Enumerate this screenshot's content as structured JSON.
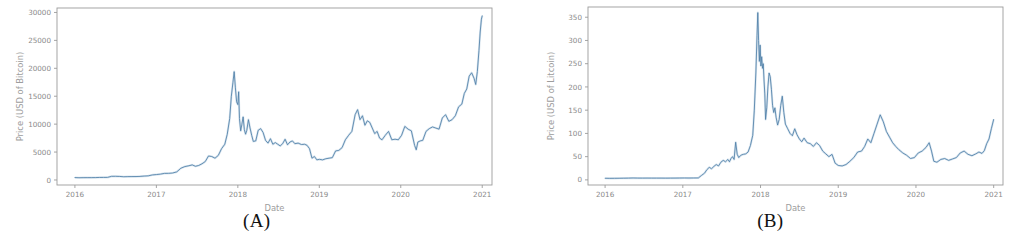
{
  "figure": {
    "background": "#ffffff",
    "panels": [
      {
        "id": "panel-a",
        "caption": "(A)",
        "chart_data": {
          "type": "line",
          "title": "",
          "xlabel": "Date",
          "ylabel": "Price (USD of Bitcoin)",
          "line_color": "#4f7fa8",
          "accent_color": "#2f6ea8",
          "axis_color": "#9b9b9b",
          "label_color": "#8a8a8a",
          "grid": false,
          "legend": "none",
          "xlim": [
            2015.78,
            2021.12
          ],
          "ylim": [
            -900,
            30800
          ],
          "xticks": [
            2016,
            2017,
            2018,
            2019,
            2020,
            2021
          ],
          "xtick_labels": [
            "2016",
            "2017",
            "2018",
            "2019",
            "2020",
            "2021"
          ],
          "yticks": [
            0,
            5000,
            10000,
            15000,
            20000,
            25000,
            30000
          ],
          "ytick_labels": [
            "0",
            "5000",
            "10000",
            "15000",
            "20000",
            "25000",
            "30000"
          ],
          "series": [
            {
              "name": "Bitcoin close price",
              "x": [
                2016.0,
                2016.05,
                2016.1,
                2016.15,
                2016.2,
                2016.25,
                2016.3,
                2016.35,
                2016.4,
                2016.45,
                2016.5,
                2016.55,
                2016.6,
                2016.65,
                2016.7,
                2016.75,
                2016.8,
                2016.85,
                2016.9,
                2016.95,
                2017.0,
                2017.05,
                2017.1,
                2017.15,
                2017.2,
                2017.25,
                2017.3,
                2017.35,
                2017.4,
                2017.44,
                2017.48,
                2017.52,
                2017.56,
                2017.6,
                2017.64,
                2017.68,
                2017.72,
                2017.76,
                2017.8,
                2017.84,
                2017.87,
                2017.9,
                2017.92,
                2017.94,
                2017.955,
                2017.97,
                2017.985,
                2018.0,
                2018.01,
                2018.02,
                2018.035,
                2018.05,
                2018.065,
                2018.08,
                2018.095,
                2018.11,
                2018.13,
                2018.15,
                2018.17,
                2018.19,
                2018.22,
                2018.25,
                2018.28,
                2018.31,
                2018.34,
                2018.37,
                2018.4,
                2018.43,
                2018.46,
                2018.49,
                2018.52,
                2018.55,
                2018.58,
                2018.61,
                2018.64,
                2018.67,
                2018.7,
                2018.74,
                2018.78,
                2018.82,
                2018.85,
                2018.88,
                2018.91,
                2018.94,
                2018.97,
                2019.0,
                2019.04,
                2019.08,
                2019.12,
                2019.16,
                2019.2,
                2019.24,
                2019.28,
                2019.32,
                2019.36,
                2019.4,
                2019.44,
                2019.47,
                2019.5,
                2019.53,
                2019.56,
                2019.59,
                2019.62,
                2019.65,
                2019.68,
                2019.71,
                2019.74,
                2019.77,
                2019.81,
                2019.85,
                2019.89,
                2019.93,
                2019.97,
                2020.01,
                2020.05,
                2020.09,
                2020.13,
                2020.17,
                2020.19,
                2020.21,
                2020.24,
                2020.27,
                2020.31,
                2020.35,
                2020.39,
                2020.43,
                2020.47,
                2020.51,
                2020.55,
                2020.59,
                2020.63,
                2020.67,
                2020.71,
                2020.75,
                2020.78,
                2020.81,
                2020.84,
                2020.87,
                2020.9,
                2020.92,
                2020.94,
                2020.96,
                2020.975,
                2020.99,
                2021.0
              ],
              "y": [
                430,
                400,
                415,
                420,
                420,
                430,
                450,
                455,
                465,
                655,
                660,
                630,
                575,
                600,
                610,
                615,
                640,
                700,
                740,
                900,
                970,
                1050,
                1180,
                1190,
                1250,
                1450,
                2100,
                2400,
                2550,
                2700,
                2450,
                2600,
                2900,
                3300,
                4300,
                4200,
                3900,
                4400,
                5600,
                6400,
                8200,
                11000,
                15000,
                17500,
                19400,
                16500,
                14000,
                13500,
                15800,
                11000,
                8800,
                10000,
                11300,
                9000,
                8200,
                8900,
                10800,
                9300,
                8000,
                6900,
                7000,
                8900,
                9200,
                8500,
                7100,
                6600,
                7400,
                6400,
                6700,
                6400,
                6100,
                6500,
                7300,
                6300,
                6800,
                7000,
                6500,
                6600,
                6350,
                6400,
                6200,
                5600,
                3900,
                4200,
                3600,
                3700,
                3600,
                3800,
                3900,
                4000,
                5200,
                5300,
                5800,
                7200,
                8000,
                8700,
                11700,
                12600,
                10800,
                11500,
                9800,
                10600,
                10300,
                9300,
                8300,
                8700,
                7500,
                7200,
                8000,
                8700,
                7200,
                7300,
                7200,
                8000,
                9600,
                9100,
                8800,
                6200,
                5400,
                6800,
                7000,
                7100,
                8700,
                9200,
                9500,
                9300,
                9100,
                11100,
                11700,
                10500,
                10800,
                11500,
                13100,
                13600,
                15500,
                16300,
                18600,
                19200,
                18200,
                17100,
                19400,
                23200,
                26500,
                28800,
                29400
              ]
            }
          ]
        },
        "axes": {
          "xlabel_text": "Date",
          "ylabel_text": "Price (USD of Bitcoin)"
        }
      },
      {
        "id": "panel-b",
        "caption": "(B)",
        "chart_data": {
          "type": "line",
          "title": "",
          "xlabel": "Date",
          "ylabel": "Price (USD of Litcoin)",
          "line_color": "#4f7fa8",
          "accent_color": "#2f6ea8",
          "axis_color": "#9b9b9b",
          "label_color": "#8a8a8a",
          "grid": false,
          "legend": "none",
          "xlim": [
            2015.78,
            2021.12
          ],
          "ylim": [
            -11,
            372
          ],
          "xticks": [
            2016,
            2017,
            2018,
            2019,
            2020,
            2021
          ],
          "xtick_labels": [
            "2016",
            "2017",
            "2018",
            "2019",
            "2020",
            "2021"
          ],
          "yticks": [
            0,
            50,
            100,
            150,
            200,
            250,
            300,
            350
          ],
          "ytick_labels": [
            "0",
            "50",
            "100",
            "150",
            "200",
            "250",
            "300",
            "350"
          ],
          "series": [
            {
              "name": "Litecoin close price",
              "x": [
                2016.0,
                2016.06,
                2016.12,
                2016.18,
                2016.24,
                2016.3,
                2016.36,
                2016.42,
                2016.48,
                2016.54,
                2016.6,
                2016.66,
                2016.72,
                2016.78,
                2016.84,
                2016.9,
                2016.96,
                2017.02,
                2017.08,
                2017.14,
                2017.2,
                2017.24,
                2017.28,
                2017.31,
                2017.34,
                2017.37,
                2017.4,
                2017.43,
                2017.46,
                2017.49,
                2017.52,
                2017.55,
                2017.58,
                2017.6,
                2017.62,
                2017.64,
                2017.66,
                2017.68,
                2017.7,
                2017.72,
                2017.74,
                2017.76,
                2017.78,
                2017.81,
                2017.84,
                2017.87,
                2017.9,
                2017.92,
                2017.94,
                2017.955,
                2017.965,
                2017.975,
                2017.985,
                2017.995,
                2018.005,
                2018.015,
                2018.025,
                2018.035,
                2018.045,
                2018.055,
                2018.065,
                2018.08,
                2018.095,
                2018.11,
                2018.125,
                2018.14,
                2018.155,
                2018.17,
                2018.185,
                2018.2,
                2018.22,
                2018.24,
                2018.26,
                2018.28,
                2018.3,
                2018.32,
                2018.35,
                2018.38,
                2018.41,
                2018.44,
                2018.47,
                2018.5,
                2018.53,
                2018.56,
                2018.6,
                2018.64,
                2018.68,
                2018.72,
                2018.76,
                2018.8,
                2018.84,
                2018.88,
                2018.92,
                2018.96,
                2019.0,
                2019.05,
                2019.1,
                2019.15,
                2019.2,
                2019.25,
                2019.3,
                2019.34,
                2019.38,
                2019.42,
                2019.46,
                2019.5,
                2019.54,
                2019.58,
                2019.62,
                2019.66,
                2019.7,
                2019.74,
                2019.78,
                2019.83,
                2019.88,
                2019.93,
                2019.98,
                2020.03,
                2020.08,
                2020.13,
                2020.17,
                2020.2,
                2020.23,
                2020.27,
                2020.32,
                2020.37,
                2020.42,
                2020.47,
                2020.52,
                2020.57,
                2020.62,
                2020.67,
                2020.72,
                2020.77,
                2020.81,
                2020.85,
                2020.88,
                2020.91,
                2020.94,
                2020.97,
                2021.0
              ],
              "y": [
                3.5,
                3.3,
                3.4,
                3.5,
                3.6,
                3.8,
                4.1,
                3.9,
                3.8,
                3.9,
                3.8,
                3.8,
                3.8,
                3.7,
                3.8,
                3.9,
                4.0,
                4.1,
                4.0,
                4.1,
                4.2,
                9.5,
                14.5,
                22.0,
                27.0,
                24.0,
                29.0,
                33.0,
                30.0,
                38.0,
                42.0,
                39.0,
                44.0,
                39.0,
                46.0,
                50.0,
                44.0,
                81.0,
                55.0,
                48.0,
                52.0,
                54.0,
                55.0,
                56.0,
                60.0,
                74.0,
                96.0,
                150.0,
                230.0,
                310.0,
                360.0,
                300.0,
                255.0,
                290.0,
                245.0,
                265.0,
                240.0,
                250.0,
                215.0,
                185.0,
                130.0,
                155.0,
                200.0,
                230.0,
                222.0,
                195.0,
                160.0,
                145.0,
                155.0,
                135.0,
                118.0,
                130.0,
                160.0,
                180.0,
                145.0,
                120.0,
                110.0,
                100.0,
                95.0,
                110.0,
                97.0,
                88.0,
                82.0,
                90.0,
                80.0,
                78.0,
                72.0,
                80.0,
                74.0,
                62.0,
                56.0,
                50.0,
                55.0,
                36.0,
                31.0,
                30.0,
                33.0,
                40.0,
                48.0,
                60.0,
                62.0,
                72.0,
                88.0,
                80.0,
                100.0,
                120.0,
                140.0,
                125.0,
                104.0,
                92.0,
                80.0,
                72.0,
                65.0,
                58.0,
                53.0,
                46.0,
                48.0,
                58.0,
                62.0,
                70.0,
                80.0,
                62.0,
                40.0,
                38.0,
                44.0,
                46.0,
                42.0,
                45.0,
                48.0,
                58.0,
                62.0,
                55.0,
                52.0,
                56.0,
                60.0,
                57.0,
                63.0,
                78.0,
                88.0,
                110.0,
                130.0
              ]
            }
          ]
        },
        "axes": {
          "xlabel_text": "Date",
          "ylabel_text": "Price (USD of Litcoin)"
        }
      }
    ]
  }
}
